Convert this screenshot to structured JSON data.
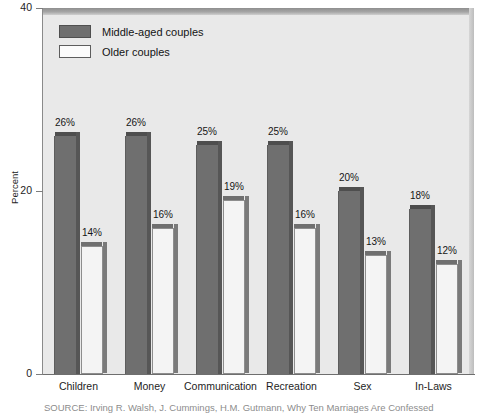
{
  "chart_data": {
    "type": "bar",
    "title": "",
    "xlabel": "",
    "ylabel": "Percent",
    "ylim": [
      0,
      40
    ],
    "yticks": [
      0,
      20,
      40
    ],
    "ytick_labels": [
      "0",
      "20",
      "40"
    ],
    "grid": false,
    "legend_position": "top-left",
    "categories": [
      "Children",
      "Money",
      "Communication",
      "Recreation",
      "Sex",
      "In-Laws"
    ],
    "series": [
      {
        "name": "Middle-aged couples",
        "color": "#6f6f6f",
        "values": [
          26,
          26,
          25,
          25,
          20,
          18
        ],
        "value_labels": [
          "26%",
          "26%",
          "25%",
          "25%",
          "20%",
          "18%"
        ]
      },
      {
        "name": "Older couples",
        "color": "#f4f4f4",
        "values": [
          14,
          16,
          19,
          16,
          13,
          12
        ],
        "value_labels": [
          "14%",
          "16%",
          "19%",
          "16%",
          "13%",
          "12%"
        ]
      }
    ]
  },
  "legend": {
    "items": [
      {
        "label": "Middle-aged couples",
        "swatch": "dark"
      },
      {
        "label": "Older couples",
        "swatch": "light"
      }
    ]
  },
  "axes": {
    "y_title": "Percent",
    "y_labels": [
      "40",
      "20",
      "0"
    ]
  },
  "source_note": {
    "text": "SOURCE: Irving R. Walsh, J. Cummings, H.M. Gutmann, Why Ten Marriages Are Confessed"
  }
}
